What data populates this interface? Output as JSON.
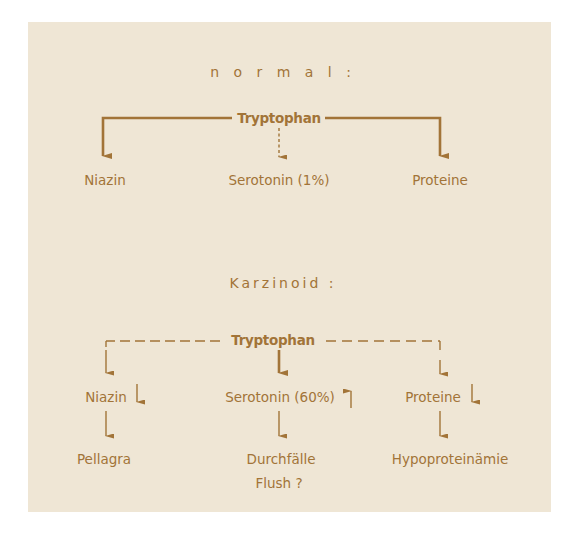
{
  "colors": {
    "background": "#ffffff",
    "panel": "#efe6d5",
    "ink": "#a27438"
  },
  "normal": {
    "heading": "n o r m a l :",
    "source": "Tryptophan",
    "targets": [
      {
        "label": "Niazin",
        "connector": "solid"
      },
      {
        "label": "Serotonin (1%)",
        "connector": "dashed"
      },
      {
        "label": "Proteine",
        "connector": "solid"
      }
    ]
  },
  "karzinoid": {
    "heading": "Karzinoid :",
    "source": "Tryptophan",
    "targets": [
      {
        "label": "Niazin",
        "trend": "down",
        "trend_symbol": "↓",
        "connector": "dashed",
        "consequence": [
          "Pellagra"
        ]
      },
      {
        "label": "Serotonin (60%)",
        "trend": "up",
        "trend_symbol": "↑",
        "connector": "solid",
        "consequence": [
          "Durchfälle",
          "Flush ?"
        ]
      },
      {
        "label": "Proteine",
        "trend": "down",
        "trend_symbol": "↓",
        "connector": "dashed",
        "consequence": [
          "Hypoproteinämie"
        ]
      }
    ]
  }
}
